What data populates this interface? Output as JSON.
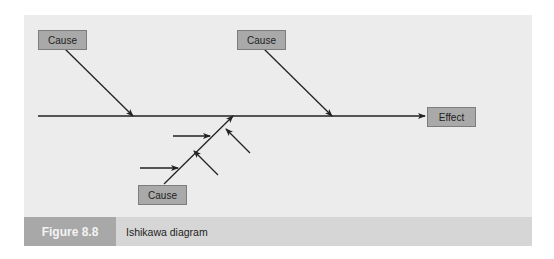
{
  "diagram": {
    "type": "ishikawa",
    "causes": [
      {
        "id": "cause-top-left",
        "label": "Cause"
      },
      {
        "id": "cause-top-right",
        "label": "Cause"
      },
      {
        "id": "cause-bottom",
        "label": "Cause"
      }
    ],
    "effect": {
      "label": "Effect"
    }
  },
  "caption": {
    "figure_label": "Figure 8.8",
    "title": "Ishikawa diagram"
  },
  "colors": {
    "panel_bg": "#ececec",
    "box_fill": "#a9a9a9",
    "caption_bg": "#d6d6d6",
    "figure_label_bg": "#a8a8a8",
    "line": "#222222"
  }
}
